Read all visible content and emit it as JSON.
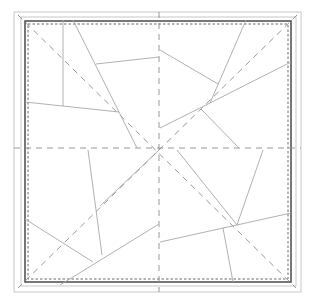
{
  "diagram": {
    "type": "crease-pattern",
    "canvas": {
      "width": 312,
      "height": 298
    },
    "colors": {
      "background": "#ffffff",
      "outer_frame": "#c8c8c8",
      "paper_edge": "#555555",
      "crease": "#a8a8a8",
      "dashed_guide": "#8c8c8c",
      "dotted_border": "#6a6a6a"
    },
    "frames": {
      "outer": {
        "x": 14,
        "y": 12,
        "w": 287,
        "h": 280
      },
      "middle": {
        "x": 21,
        "y": 17,
        "w": 275,
        "h": 269
      },
      "paper": {
        "x": 25,
        "y": 21,
        "w": 266,
        "h": 261
      },
      "dotted_inner": {
        "x": 28,
        "y": 24,
        "w": 260,
        "h": 255
      }
    },
    "center": {
      "x": 159,
      "y": 149
    },
    "dashed_guides": [
      {
        "name": "vertical-center",
        "x1": 159,
        "y1": 12,
        "x2": 159,
        "y2": 292
      },
      {
        "name": "horizontal-center",
        "x1": 14,
        "y1": 148,
        "x2": 301,
        "y2": 148
      },
      {
        "name": "diagonal-tl-br",
        "x1": 18,
        "y1": 15,
        "x2": 296,
        "y2": 288
      },
      {
        "name": "diagonal-tr-bl",
        "x1": 297,
        "y1": 15,
        "x2": 18,
        "y2": 288
      }
    ],
    "creases": [
      {
        "name": "tl-vertical",
        "x1": 63,
        "y1": 20,
        "x2": 63,
        "y2": 106
      },
      {
        "name": "tl-long-slant",
        "x1": 73,
        "y1": 20,
        "x2": 137,
        "y2": 148
      },
      {
        "name": "tl-upper-horizontal",
        "x1": 96,
        "y1": 64,
        "x2": 159,
        "y2": 57
      },
      {
        "name": "tl-lower-horizontal",
        "x1": 25,
        "y1": 102,
        "x2": 119,
        "y2": 112
      },
      {
        "name": "tr-long-slant",
        "x1": 246,
        "y1": 20,
        "x2": 210,
        "y2": 103
      },
      {
        "name": "tr-upper",
        "x1": 160,
        "y1": 50,
        "x2": 218,
        "y2": 84
      },
      {
        "name": "tr-right-to-center",
        "x1": 291,
        "y1": 62,
        "x2": 208,
        "y2": 104
      },
      {
        "name": "tr-center-left",
        "x1": 208,
        "y1": 104,
        "x2": 160,
        "y2": 128
      },
      {
        "name": "tr-lower-slant",
        "x1": 201,
        "y1": 109,
        "x2": 239,
        "y2": 148
      },
      {
        "name": "bl-vertical",
        "x1": 88,
        "y1": 150,
        "x2": 102,
        "y2": 255
      },
      {
        "name": "bl-left-slant",
        "x1": 25,
        "y1": 219,
        "x2": 93,
        "y2": 262
      },
      {
        "name": "bl-bottom-slant",
        "x1": 60,
        "y1": 285,
        "x2": 159,
        "y2": 224
      },
      {
        "name": "bl-diagonal-solid",
        "x1": 100,
        "y1": 206,
        "x2": 159,
        "y2": 150
      },
      {
        "name": "br-long-slant",
        "x1": 177,
        "y1": 150,
        "x2": 237,
        "y2": 225
      },
      {
        "name": "br-upper",
        "x1": 263,
        "y1": 150,
        "x2": 237,
        "y2": 225
      },
      {
        "name": "br-horizontal",
        "x1": 160,
        "y1": 242,
        "x2": 291,
        "y2": 213
      },
      {
        "name": "br-vertical",
        "x1": 223,
        "y1": 228,
        "x2": 233,
        "y2": 282
      }
    ]
  }
}
